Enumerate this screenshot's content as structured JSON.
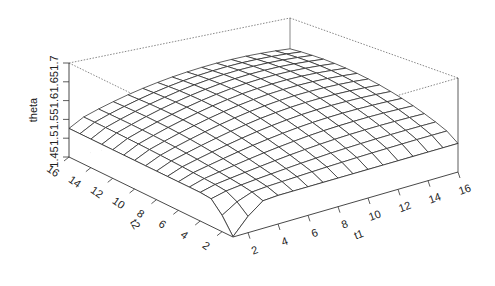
{
  "chart_data": {
    "type": "surface",
    "title": "",
    "xlabel": "t1",
    "ylabel": "t2",
    "zlabel": "theta",
    "x": [
      1,
      2,
      3,
      4,
      5,
      6,
      7,
      8,
      9,
      10,
      11,
      12,
      13,
      14,
      15,
      16
    ],
    "y": [
      1,
      2,
      3,
      4,
      5,
      6,
      7,
      8,
      9,
      10,
      11,
      12,
      13,
      14,
      15,
      16
    ],
    "x_ticks": [
      "2",
      "4",
      "6",
      "8",
      "10",
      "12",
      "14",
      "16"
    ],
    "y_ticks": [
      "2",
      "4",
      "6",
      "8",
      "10",
      "12",
      "14",
      "16"
    ],
    "z_ticks": [
      "1.45",
      "1.5",
      "1.55",
      "1.6",
      "1.65",
      "1.7"
    ],
    "xlim": [
      1,
      16
    ],
    "ylim": [
      1,
      16
    ],
    "zlim": [
      1.45,
      1.7
    ],
    "corner_values": {
      "t1_1_t2_1": 1.455,
      "t1_1_t2_16": 1.53,
      "t1_16_t2_1": 1.535,
      "t1_16_t2_16": 1.69
    },
    "grid": "off",
    "box": "on"
  }
}
